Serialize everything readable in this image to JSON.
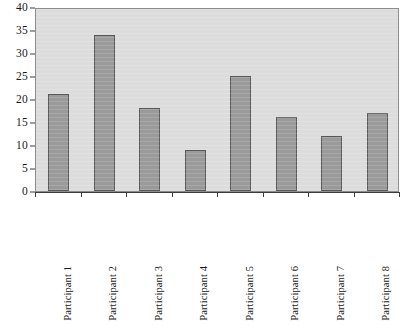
{
  "chart_data": {
    "type": "bar",
    "title": "",
    "subtitle": "",
    "xlabel": "",
    "ylabel": "",
    "categories": [
      "Participant 1",
      "Participant 2",
      "Participant 3",
      "Participant 4",
      "Participant 5",
      "Participant 6",
      "Participant 7",
      "Participant 8"
    ],
    "values": [
      21,
      34,
      18,
      9,
      25,
      16,
      12,
      17
    ],
    "ylim": [
      0,
      40
    ],
    "ytick_labels": [
      "0",
      "5",
      "10",
      "15",
      "20",
      "25",
      "30",
      "35",
      "40"
    ],
    "ytick_values": [
      0,
      5,
      10,
      15,
      20,
      25,
      30,
      35,
      40
    ],
    "grid": false,
    "legend": null,
    "annotations": [],
    "colors": {
      "bar_fill": "#9a9a9a",
      "bar_border": "#585858",
      "plot_background": "#dcdcdc",
      "plot_frame": "#8d8d8d",
      "axis_line": "#3c3c3c",
      "text": "#1a1a1a",
      "page_background": "#ffffff"
    },
    "xtick_label_rotation": -90
  }
}
